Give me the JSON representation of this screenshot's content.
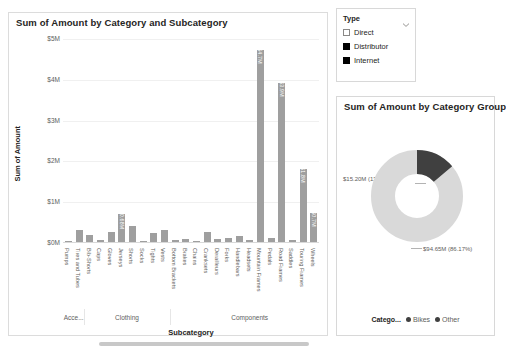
{
  "bar_panel": {
    "title": "Sum of Amount by Category and Subcategory",
    "y_axis_title": "Sum of Amount",
    "x_axis_title": "Subcategory",
    "scrollbar": "horizontal-scrollbar"
  },
  "slicer": {
    "title": "Type",
    "chevron": "chevron-down-icon",
    "items": [
      {
        "label": "Direct",
        "checked": false
      },
      {
        "label": "Distributor",
        "checked": true
      },
      {
        "label": "Internet",
        "checked": true
      }
    ]
  },
  "donut_panel": {
    "title": "Sum of Amount by Category Group",
    "legend_title": "Catego...",
    "label_bikes": "$15.20M (13.83%)",
    "label_other": "$94.65M (86.17%)"
  },
  "colors": {
    "bar": "#9f9f9f",
    "donut_bikes": "#404040",
    "donut_other": "#d9d9d9",
    "grid": "#f0f0f0",
    "text": "#605e5c",
    "title": "#252423"
  },
  "chart_data": [
    {
      "type": "bar",
      "title": "Sum of Amount by Category and Subcategory",
      "xlabel": "Subcategory",
      "ylabel": "Sum of Amount",
      "ylim": [
        0,
        5000000
      ],
      "ytick_labels": [
        "$5M",
        "$4M",
        "$3M",
        "$2M",
        "$1M",
        "$0M"
      ],
      "ytick_values": [
        5000000,
        4000000,
        3000000,
        2000000,
        1000000,
        0
      ],
      "grid": true,
      "legend": "none",
      "category_groups": [
        {
          "label": "Acce...",
          "start": 0,
          "end": 2
        },
        {
          "label": "Clothing",
          "start": 2,
          "end": 10
        },
        {
          "label": "Components",
          "start": 10,
          "end": 25
        }
      ],
      "categories": [
        "Pumps",
        "Tires and Tubes",
        "Bib-Shorts",
        "Caps",
        "Gloves",
        "Jerseys",
        "Shorts",
        "Socks",
        "Tights",
        "Vests",
        "Bottom Brackets",
        "Brakes",
        "Chains",
        "Cranksets",
        "Derailleurs",
        "Forks",
        "Handlebars",
        "Headsets",
        "Mountain Frames",
        "Pedals",
        "Road Frames",
        "Saddles",
        "Touring Frames",
        "Wheels"
      ],
      "values": [
        30000,
        300000,
        160000,
        40000,
        250000,
        680000,
        400000,
        20000,
        230000,
        290000,
        45000,
        80000,
        15000,
        240000,
        70000,
        100000,
        150000,
        60000,
        4700000,
        110000,
        3900000,
        45000,
        1800000,
        700000
      ],
      "data_labels": [
        null,
        null,
        null,
        null,
        null,
        "$0.68M",
        null,
        null,
        null,
        null,
        null,
        null,
        null,
        null,
        null,
        null,
        null,
        null,
        "$4.7M",
        null,
        "$3.9M",
        null,
        "$1.8M",
        "$0.7M"
      ]
    },
    {
      "type": "pie",
      "subtype": "donut",
      "title": "Sum of Amount by Category Group",
      "legend_title": "Catego...",
      "legend_position": "bottom",
      "labels": [
        "Bikes",
        "Other"
      ],
      "values": [
        15200000,
        94650000
      ],
      "percents": [
        13.83,
        86.17
      ],
      "data_labels": [
        "$15.20M (13.83%)",
        "$94.65M (86.17%)"
      ],
      "colors": [
        "#404040",
        "#d9d9d9"
      ]
    }
  ]
}
